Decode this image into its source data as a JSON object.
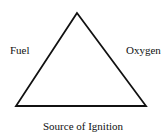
{
  "diagram": {
    "labels": {
      "left": "Fuel",
      "right": "Oxygen",
      "bottom": "Source of Ignition"
    },
    "triangle": {
      "apex": [
        77,
        13
      ],
      "bottom_left": [
        16,
        106
      ],
      "bottom_right": [
        146,
        106
      ],
      "stroke": "#111111"
    }
  }
}
